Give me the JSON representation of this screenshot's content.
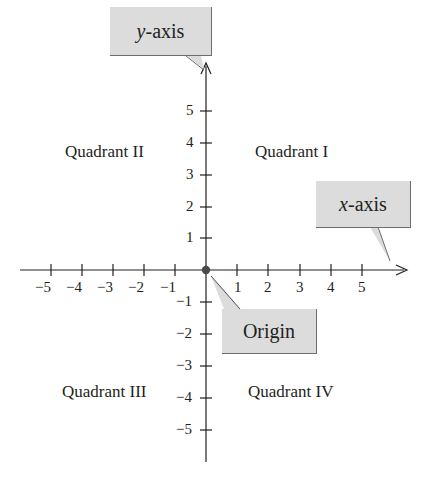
{
  "diagram": {
    "type": "cartesian-coordinate-plane",
    "x_axis": {
      "label_italic": "x",
      "label_rest": "-axis",
      "ticks": [
        -5,
        -4,
        -3,
        -2,
        -1,
        1,
        2,
        3,
        4,
        5
      ],
      "tick_labels": [
        "−5",
        "−4",
        "−3",
        "−2",
        "−1",
        "1",
        "2",
        "3",
        "4",
        "5"
      ]
    },
    "y_axis": {
      "label_italic": "y",
      "label_rest": "-axis",
      "ticks": [
        5,
        4,
        3,
        2,
        1,
        -1,
        -2,
        -3,
        -4,
        -5
      ],
      "tick_labels": [
        "5",
        "4",
        "3",
        "2",
        "1",
        "−1",
        "−2",
        "−3",
        "−4",
        "−5"
      ]
    },
    "origin": {
      "label": "Origin",
      "point": [
        0,
        0
      ]
    },
    "quadrants": {
      "q1": "Quadrant I",
      "q2": "Quadrant II",
      "q3": "Quadrant III",
      "q4": "Quadrant IV"
    },
    "colors": {
      "ink": "#231f20",
      "callout_fill": "#dcdcdc",
      "callout_shadow": "#6e6e6e",
      "origin_dot": "#4a4a4a"
    }
  }
}
